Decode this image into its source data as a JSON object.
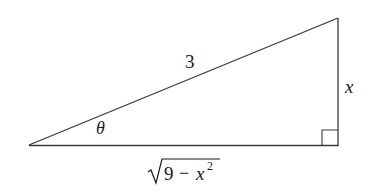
{
  "diagram": {
    "type": "right-triangle",
    "stroke_color": "#3a3a3a",
    "background": "#ffffff",
    "vertices": {
      "left": [
        29,
        145
      ],
      "top_right": [
        338,
        18
      ],
      "bottom_right": [
        338,
        145
      ]
    },
    "labels": {
      "hypotenuse": "3",
      "angle": "θ",
      "opposite": "x",
      "adjacent_radicand_a": "9",
      "adjacent_minus": "−",
      "adjacent_var": "x",
      "adjacent_exp": "2"
    },
    "right_angle_marker": true
  }
}
